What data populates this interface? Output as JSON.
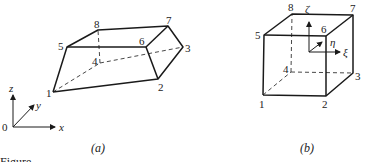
{
  "figure_a": {
    "caption": "(a)",
    "node_labels": {
      "n1": "1",
      "n2": "2",
      "n3": "3",
      "n4": "4",
      "n5": "5",
      "n6": "6",
      "n7": "7",
      "n8": "8"
    },
    "axes": {
      "origin": "0",
      "x": "x",
      "y": "y",
      "z": "z"
    }
  },
  "figure_b": {
    "caption": "(b)",
    "node_labels": {
      "n1": "1",
      "n2": "2",
      "n3": "3",
      "n4": "4",
      "n5": "5",
      "n6": "6",
      "n7": "7",
      "n8": "8"
    },
    "axes": {
      "xi": "ξ",
      "eta": "η",
      "zeta": "ζ"
    }
  },
  "footer_fragment": "Figure"
}
